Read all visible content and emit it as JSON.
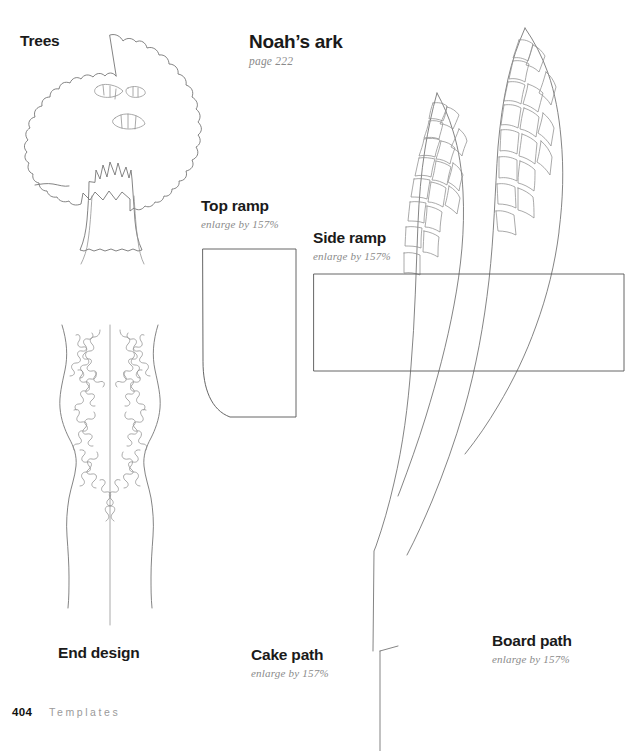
{
  "page": {
    "background_color": "#ffffff",
    "line_color": "#6e6e6e",
    "text_color": "#1a1a1a",
    "muted_text_color": "#8a8a8a",
    "width": 637,
    "height": 751
  },
  "heading": {
    "title": "Noah’s ark",
    "subtitle": "page 222"
  },
  "labels": {
    "trees": {
      "title": "Trees",
      "subtitle": ""
    },
    "top_ramp": {
      "title": "Top ramp",
      "subtitle": "enlarge by 157%"
    },
    "side_ramp": {
      "title": "Side ramp",
      "subtitle": "enlarge by 157%"
    },
    "end_design": {
      "title": "End design",
      "subtitle": ""
    },
    "cake_path": {
      "title": "Cake path",
      "subtitle": "enlarge by 157%"
    },
    "board_path": {
      "title": "Board path",
      "subtitle": "enlarge by 157%"
    }
  },
  "footer": {
    "page_number": "404",
    "section": "Templates"
  },
  "templates": [
    {
      "name": "Trees",
      "enlarge": "",
      "description": "outline of a leafy tree with trunk"
    },
    {
      "name": "Top ramp",
      "enlarge": "enlarge by 157%",
      "description": "rectangle with one rounded corner"
    },
    {
      "name": "Side ramp",
      "enlarge": "enlarge by 157%",
      "description": "wide rectangle"
    },
    {
      "name": "End design",
      "enlarge": "",
      "description": "symmetric filigree panel"
    },
    {
      "name": "Cake path",
      "enlarge": "enlarge by 157%",
      "description": "curved path with cobbles"
    },
    {
      "name": "Board path",
      "enlarge": "enlarge by 157%",
      "description": "long curved path with cobbles"
    }
  ]
}
